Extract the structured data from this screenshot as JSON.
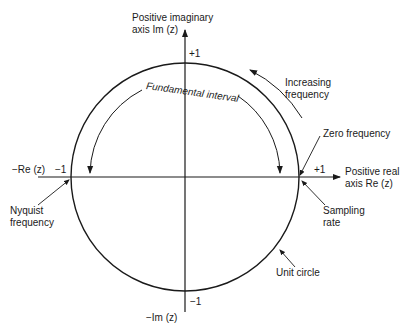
{
  "diagram": {
    "axes": {
      "positive_imaginary": {
        "line1": "Positive imaginary",
        "line2": "axis Im (z)"
      },
      "negative_imaginary": "−Im (z)",
      "positive_real": {
        "line1": "Positive real",
        "line2": "axis Re (z)"
      },
      "negative_real": "−Re (z)"
    },
    "ticks": {
      "top": "+1",
      "bottom": "−1",
      "right": "+1",
      "left": "−1"
    },
    "annotations": {
      "fundamental_interval": "Fundamental interval",
      "increasing_frequency": {
        "line1": "Increasing",
        "line2": "frequency"
      },
      "zero_frequency": "Zero frequency",
      "sampling_rate": {
        "line1": "Sampling",
        "line2": "rate"
      },
      "nyquist_frequency": {
        "line1": "Nyquist",
        "line2": "frequency"
      },
      "unit_circle": "Unit circle"
    },
    "geometry": {
      "center_x": 185,
      "center_y": 177,
      "radius": 114
    }
  }
}
